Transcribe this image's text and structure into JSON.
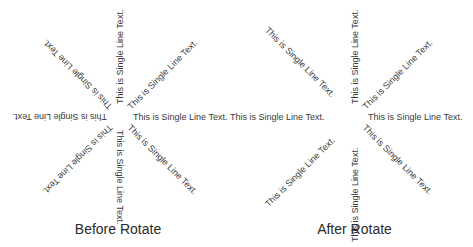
{
  "diagram": {
    "label_text": "This is Single Line Text.",
    "text_color": "#3a3a3a",
    "panels": [
      {
        "id": "before",
        "caption": "Before Rotate",
        "center": [
          120,
          117
        ],
        "labels": [
          {
            "angle_deg": 0,
            "reading": "outward",
            "text": "This is Single Line Text."
          },
          {
            "angle_deg": 45,
            "reading": "outward",
            "text": "This is Single Line Text."
          },
          {
            "angle_deg": 90,
            "reading": "outward",
            "text": "This is Single Line Text."
          },
          {
            "angle_deg": 135,
            "reading": "outward",
            "text": "This is Single Line Text."
          },
          {
            "angle_deg": 180,
            "reading": "outward",
            "text": "This is Single Line Text."
          },
          {
            "angle_deg": 225,
            "reading": "outward",
            "text": "This is Single Line Text."
          },
          {
            "angle_deg": 270,
            "reading": "outward",
            "text": "This is Single Line Text."
          },
          {
            "angle_deg": 315,
            "reading": "outward",
            "text": "This is Single Line Text."
          }
        ]
      },
      {
        "id": "after",
        "caption": "After Rotate",
        "center": [
          355,
          117
        ],
        "labels": [
          {
            "angle_deg": 0,
            "reading": "outward",
            "text": "This is Single Line Text."
          },
          {
            "angle_deg": 45,
            "reading": "outward",
            "text": "This is Single Line Text."
          },
          {
            "angle_deg": 90,
            "reading": "flipped",
            "text": "This is Single Line Text."
          },
          {
            "angle_deg": 135,
            "reading": "flipped",
            "text": "This is Single Line Text."
          },
          {
            "angle_deg": 180,
            "reading": "flipped",
            "text": "This is Single Line Text."
          },
          {
            "angle_deg": 225,
            "reading": "flipped",
            "text": "This is Single Line Text."
          },
          {
            "angle_deg": 270,
            "reading": "outward",
            "text": "This is Single Line Text."
          },
          {
            "angle_deg": 315,
            "reading": "outward",
            "text": "This is Single Line Text."
          }
        ]
      }
    ]
  }
}
